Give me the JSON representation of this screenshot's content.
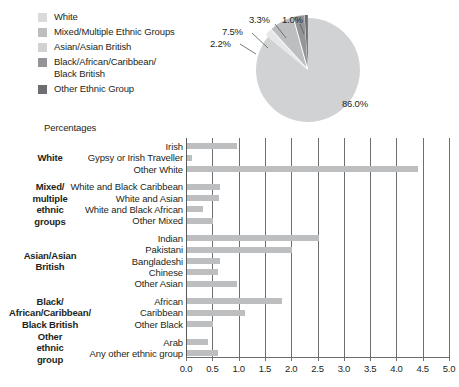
{
  "legend": {
    "items": [
      {
        "label": "White",
        "color": "#d9dadb"
      },
      {
        "label": "Mixed/Multiple Ethnic Groups",
        "color": "#bcbec0"
      },
      {
        "label": "Asian/Asian British",
        "color": "#d0d2d3"
      },
      {
        "label": "Black/African/Caribbean/\nBlack British",
        "color": "#929497"
      },
      {
        "label": "Other Ethnic Group",
        "color": "#6d6e71"
      }
    ]
  },
  "pie": {
    "callouts": [
      {
        "value": "2.2%"
      },
      {
        "value": "7.5%"
      },
      {
        "value": "3.3%"
      },
      {
        "value": "1.0%"
      },
      {
        "value": "86.0%"
      }
    ]
  },
  "axis_title": "Percentages",
  "chart_data": [
    {
      "type": "pie",
      "title": "",
      "labels": [
        "White",
        "Mixed/Multiple Ethnic Groups",
        "Asian/Asian British",
        "Black/African/Caribbean/Black British",
        "Other Ethnic Group"
      ],
      "values": [
        86.0,
        2.2,
        7.5,
        3.3,
        1.0
      ],
      "value_labels": [
        "86.0%",
        "2.2%",
        "7.5%",
        "3.3%",
        "1.0%"
      ],
      "colors": [
        "#d0d2d3",
        "#e6e7e8",
        "#bcbec0",
        "#939598",
        "#6d6e71"
      ],
      "legend_position": "left"
    },
    {
      "type": "bar",
      "orientation": "horizontal",
      "title": "",
      "xlabel": "Percentages",
      "ylabel": "",
      "xlim": [
        0.0,
        5.0
      ],
      "xticks": [
        "0.0",
        "0.5",
        "1.0",
        "1.5",
        "2.0",
        "2.5",
        "3.0",
        "3.5",
        "4.0",
        "4.5",
        "5.0"
      ],
      "grid": true,
      "bar_color": "#bcbec0",
      "groups": [
        {
          "group_label": "White",
          "categories": [
            "Irish",
            "Gypsy or Irish Traveller",
            "Other White"
          ],
          "values": [
            0.95,
            0.1,
            4.4
          ]
        },
        {
          "group_label": "Mixed/\nmultiple\nethnic\ngroups",
          "categories": [
            "White and Black Caribbean",
            "White and Asian",
            "White and Black African",
            "Other Mixed"
          ],
          "values": [
            0.63,
            0.6,
            0.3,
            0.5
          ]
        },
        {
          "group_label": "Asian/Asian\nBritish",
          "categories": [
            "Indian",
            "Pakistani",
            "Bangladeshi",
            "Chinese",
            "Other Asian"
          ],
          "values": [
            2.5,
            2.0,
            0.62,
            0.58,
            0.95
          ]
        },
        {
          "group_label": "Black/\nAfrican/Caribbean/\nBlack British",
          "categories": [
            "African",
            "Caribbean",
            "Other Black"
          ],
          "values": [
            1.8,
            1.1,
            0.5
          ]
        },
        {
          "group_label": "Other\nethnic\ngroup",
          "categories": [
            "Arab",
            "Any other ethnic group"
          ],
          "values": [
            0.4,
            0.58
          ]
        }
      ]
    }
  ]
}
